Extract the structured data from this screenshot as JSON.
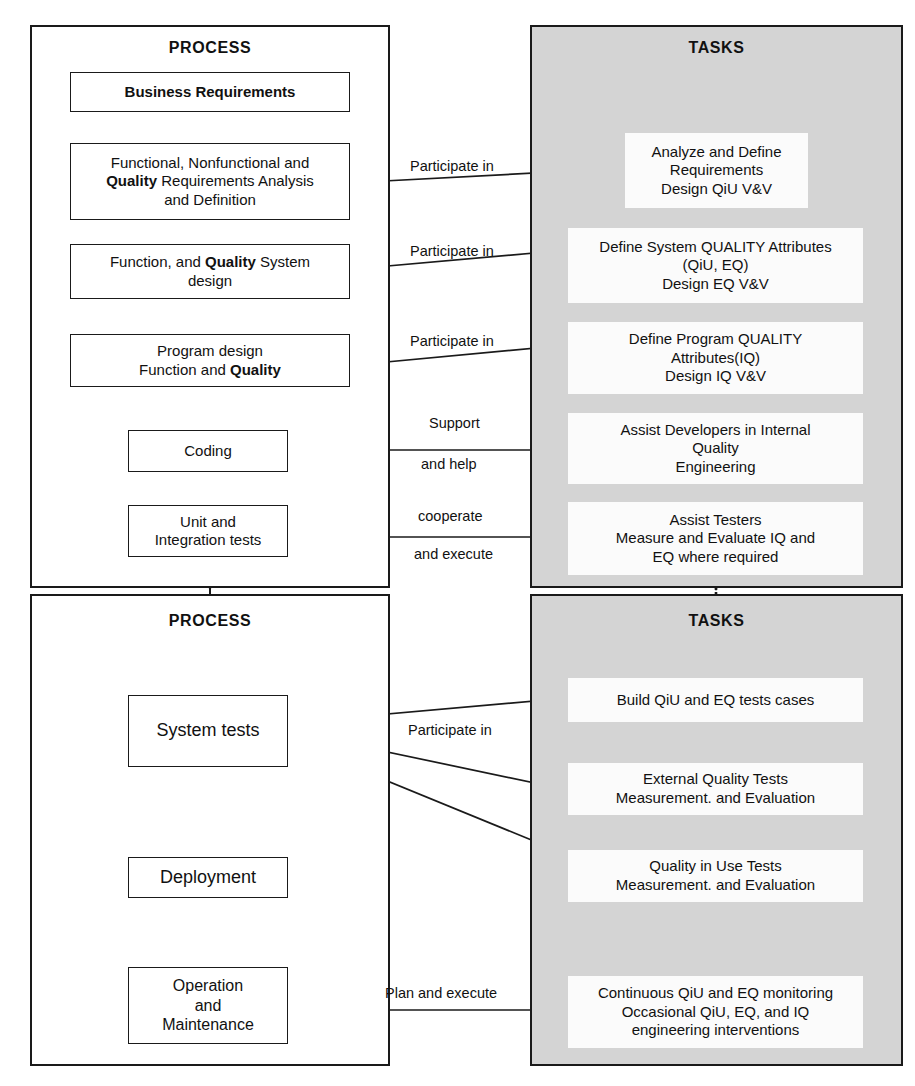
{
  "diagram": {
    "panels": [
      {
        "id": "process-top",
        "label": "PROCESS"
      },
      {
        "id": "tasks-top",
        "label": "TASKS"
      },
      {
        "id": "process-bottom",
        "label": "PROCESS"
      },
      {
        "id": "tasks-bottom",
        "label": "TASKS"
      }
    ],
    "colors": {
      "tasks_panel_background": "#d4d4d4",
      "process_panel_background": "#ffffff",
      "task_box_background": "#fbfbfb",
      "line": "#1a1a1a"
    }
  },
  "process_top": {
    "title": "PROCESS",
    "boxes": [
      {
        "id": "business-requirements",
        "line1": "Business Requirements"
      },
      {
        "id": "requirements-analysis",
        "line1": "Functional, Nonfunctional and",
        "line2_pre": "Quality",
        "line2_post": " Requirements Analysis",
        "line3": "and Definition"
      },
      {
        "id": "system-design",
        "line1_pre": "Function, and ",
        "line1_bold": "Quality",
        "line1_post": " System",
        "line2": "design"
      },
      {
        "id": "program-design",
        "line1": "Program design",
        "line2_pre": "Function and ",
        "line2_bold": "Quality"
      },
      {
        "id": "coding",
        "line1": "Coding"
      },
      {
        "id": "unit-integration-tests",
        "line1": "Unit and",
        "line2": "Integration tests"
      }
    ]
  },
  "tasks_top": {
    "title": "TASKS",
    "boxes": [
      {
        "id": "analyze-define-requirements",
        "line1": "Analyze and Define",
        "line2": "Requirements",
        "line3": "Design QiU V&V"
      },
      {
        "id": "define-system-quality-attributes",
        "line1": "Define System QUALITY Attributes",
        "line2": "(QiU, EQ)",
        "line3": "Design EQ V&V"
      },
      {
        "id": "define-program-quality-attributes",
        "line1": "Define Program QUALITY",
        "line2": "Attributes(IQ)",
        "line3": "Design IQ V&V"
      },
      {
        "id": "assist-developers",
        "line1": "Assist Developers in Internal",
        "line2": "Quality",
        "line3": "Engineering"
      },
      {
        "id": "assist-testers",
        "line1": "Assist Testers",
        "line2": "Measure and Evaluate IQ and",
        "line3": "EQ where required"
      }
    ]
  },
  "process_bottom": {
    "title": "PROCESS",
    "boxes": [
      {
        "id": "system-tests",
        "line1": "System tests"
      },
      {
        "id": "deployment",
        "line1": "Deployment"
      },
      {
        "id": "operation-maintenance",
        "line1": "Operation",
        "line2": "and",
        "line3": "Maintenance"
      }
    ]
  },
  "tasks_bottom": {
    "title": "TASKS",
    "boxes": [
      {
        "id": "build-test-cases",
        "line1": "Build QiU and EQ tests cases"
      },
      {
        "id": "external-quality-tests",
        "line1": "External Quality Tests",
        "line2": "Measurement. and Evaluation"
      },
      {
        "id": "quality-in-use-tests",
        "line1": "Quality in Use Tests",
        "line2": "Measurement. and Evaluation"
      },
      {
        "id": "continuous-monitoring",
        "line1": "Continuous QiU and EQ monitoring",
        "line2": "Occasional QiU, EQ, and IQ",
        "line3": "engineering interventions"
      }
    ]
  },
  "connector_labels": [
    {
      "id": "participate-in-1",
      "text": "Participate in"
    },
    {
      "id": "participate-in-2",
      "text": "Participate in"
    },
    {
      "id": "participate-in-3",
      "text": "Participate in"
    },
    {
      "id": "support",
      "text": "Support"
    },
    {
      "id": "and-help",
      "text": "and help"
    },
    {
      "id": "cooperate",
      "text": "cooperate"
    },
    {
      "id": "and-execute",
      "text": "and execute"
    },
    {
      "id": "participate-in-4",
      "text": "Participate in"
    },
    {
      "id": "plan-and-execute",
      "text": "Plan and execute"
    }
  ]
}
